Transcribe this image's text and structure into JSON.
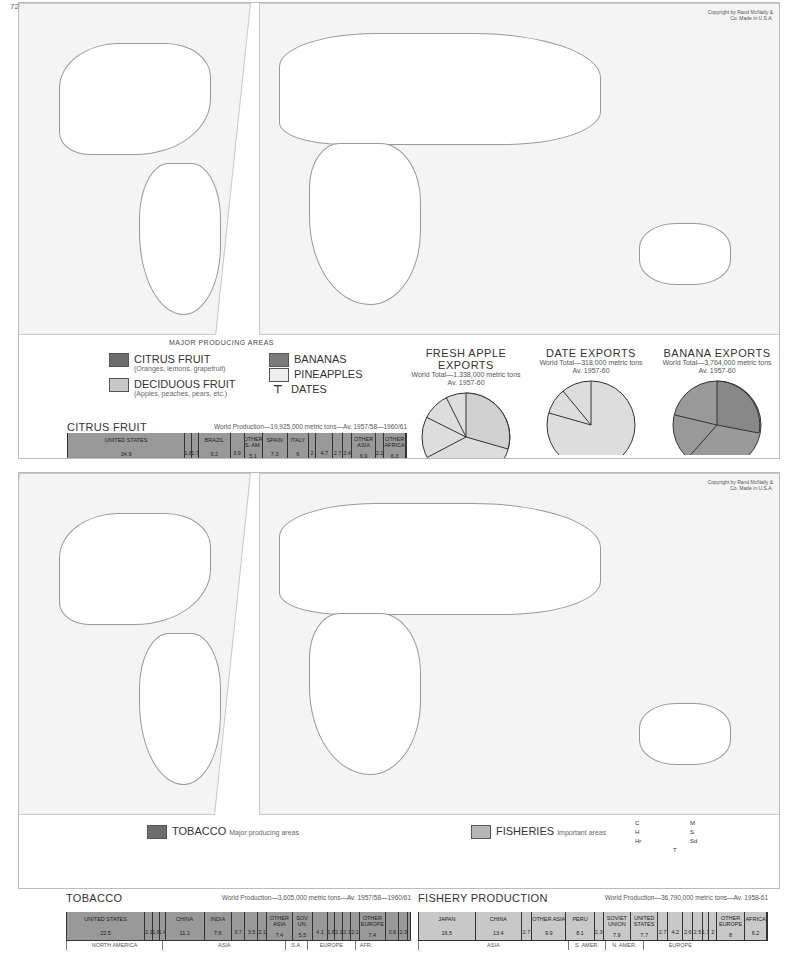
{
  "page_number": "72",
  "top_map": {
    "copyright": "Copyright by Rand McNally & Co. Made in U.S.A.",
    "subtitle": "MAJOR PRODUCING AREAS",
    "legend": [
      {
        "label": "CITRUS FRUIT",
        "note": "(Oranges, lemons, grapefruit)",
        "color": "#6e6e6e"
      },
      {
        "label": "DECIDUOUS FRUIT",
        "note": "(Apples, peaches, pears, etc.)",
        "color": "#c8c8c8"
      },
      {
        "label": "BANANAS",
        "note": "",
        "color": "#7a7a7a"
      },
      {
        "label": "PINEAPPLES",
        "note": "",
        "color": "#eeeeee"
      },
      {
        "label": "DATES",
        "note": "",
        "symbol": "T"
      }
    ],
    "map_labels": [
      "Arctic Circle",
      "Tropic of Cancer",
      "Equator",
      "Tropic of Capricorn"
    ]
  },
  "bottom_map": {
    "copyright": "Copyright by Rand McNally & Co. Made in U.S.A.",
    "legend": [
      {
        "label": "TOBACCO",
        "note": "Major producing areas",
        "color": "#6e6e6e"
      },
      {
        "label": "FISHERIES",
        "note": "Important areas",
        "color": "#b5b5b5"
      }
    ],
    "fish_codes": [
      {
        "code": "C",
        "name": "COD"
      },
      {
        "code": "M",
        "name": "MACKEREL"
      },
      {
        "code": "H",
        "name": "HALIBUT"
      },
      {
        "code": "S",
        "name": "SALMON"
      },
      {
        "code": "Hr",
        "name": "HERRING"
      },
      {
        "code": "Sd",
        "name": "SARDINE"
      },
      {
        "code": "T",
        "name": "TUNA"
      }
    ]
  },
  "chart_data": [
    {
      "type": "pie",
      "title": "FRESH APPLE EXPORTS",
      "subtitle": "World Total—1,338,000 metric tons",
      "period": "Av. 1957-60",
      "slices": [
        {
          "label": "ITALY",
          "value": 34.6
        },
        {
          "label": "NETH.",
          "value": 5.8
        },
        {
          "label": "OTHER",
          "value": 7.3
        },
        {
          "label": "ARGEN.",
          "value": 5.3
        },
        {
          "label": "AUSTL.",
          "value": 7.0
        },
        {
          "label": "OTHER ASIA",
          "value": 1.7
        },
        {
          "label": "CHINA",
          "value": 6.5
        },
        {
          "label": "CAN.",
          "value": 5.5
        },
        {
          "label": "U.S.",
          "value": 6.1
        },
        {
          "label": "OTHER N. AM.",
          "value": 2.4
        },
        {
          "label": "KOREA",
          "value": 2.5
        },
        {
          "label": "SWITZ.",
          "value": 2.8
        }
      ],
      "groups": [
        "N. AM.",
        "ASIA",
        "OCEANIA",
        "S. AM.",
        "EUROPE 55.6%"
      ]
    },
    {
      "type": "pie",
      "title": "DATE EXPORTS",
      "subtitle": "World Total—318,000 metric tons",
      "period": "Av. 1957-60",
      "slices": [
        {
          "label": "IRAQ",
          "value": 76.7
        },
        {
          "label": "IRAN",
          "value": 8.0
        },
        {
          "label": "ALG.",
          "value": 6.7
        },
        {
          "label": "FRANCE",
          "value": 2.6
        },
        {
          "label": "OTHER",
          "value": 6.0
        }
      ],
      "groups": [
        "AFR.",
        "EUR.",
        "ASIA 87.8%"
      ]
    },
    {
      "type": "pie",
      "title": "BANANA EXPORTS",
      "subtitle": "World Total—3,764,000 metric tons",
      "period": "Av. 1957-60",
      "slices": [
        {
          "label": "ECUADOR",
          "value": 25.9
        },
        {
          "label": "BRAZIL",
          "value": 6.3
        },
        {
          "label": "COL.",
          "value": 3.8
        },
        {
          "label": "HONDURAS",
          "value": 7.6
        },
        {
          "label": "PANAMA",
          "value": 7.4
        },
        {
          "label": "COSTA RICA",
          "value": 5.0
        },
        {
          "label": "GUAT.",
          "value": 4.7
        },
        {
          "label": "OTHER N. AM.",
          "value": 5.0
        },
        {
          "label": "MEX.",
          "value": 3.0
        },
        {
          "label": "CAN.",
          "value": 4.2
        },
        {
          "label": "FR. AFR.",
          "value": 6.3
        },
        {
          "label": "OTHER AFR.",
          "value": 11.0
        },
        {
          "label": "NIGERIA",
          "value": 2.0
        },
        {
          "label": "GUADELOUPE",
          "value": 2.7
        },
        {
          "label": "MARTINIQUE",
          "value": 3.0
        }
      ],
      "groups": [
        "AFRICA",
        "SOUTH AMERICA 36.3%",
        "NORTH AMERICA 45.2%"
      ]
    },
    {
      "type": "bar",
      "title": "CITRUS FRUIT",
      "subtitle": "World Production—19,925,000 metric tons—Av. 1957/58—1960/61",
      "xlim": [
        0,
        100
      ],
      "ticks": [
        0,
        10,
        20,
        30,
        40,
        50,
        60,
        70,
        80,
        90,
        "100%"
      ],
      "categories": [
        "UNITED STATES",
        "MEX.",
        "CUBA",
        "BRAZIL",
        "ARGEN.",
        "OTHER S. AM.",
        "SPAIN",
        "ITALY",
        "OTHER EUR.",
        "JAPAN",
        "ISRAEL",
        "CHINA",
        "OTHER ASIA",
        "U.A.R.",
        "OTHER AFRICA"
      ],
      "values": [
        34.9,
        1.8,
        1.7,
        9.2,
        3.9,
        5.1,
        7.3,
        6.0,
        2.0,
        4.7,
        2.7,
        2.4,
        6.9,
        2.1,
        6.3
      ],
      "regions": [
        {
          "name": "NORTH AMERICA",
          "span": 38.4
        },
        {
          "name": "S. AMERICA",
          "span": 18.2
        },
        {
          "name": "EUROPE",
          "span": 15.3
        },
        {
          "name": "ASIA",
          "span": 16.7
        },
        {
          "name": "AFR.",
          "span": 8.4
        }
      ]
    },
    {
      "type": "bar",
      "title": "TOBACCO",
      "subtitle": "World Production—3,605,000 metric tons—Av. 1957/58—1960/61",
      "xlim": [
        0,
        100
      ],
      "ticks": [
        0,
        10,
        20,
        30,
        40,
        50,
        60,
        70,
        80,
        90,
        "100%"
      ],
      "categories": [
        "UNITED STATES",
        "CAN.",
        "MEX.",
        "OTHER",
        "CHINA",
        "INDIA",
        "JAPAN",
        "TURK.",
        "PAK.",
        "OTHER ASIA",
        "SOV. UN.",
        "BRAZ.",
        "OTHER",
        "BULG.",
        "GR.",
        "ITALY",
        "OTHER EUROPE",
        "RH.-NY.",
        "OTHER"
      ],
      "values": [
        22.5,
        2.1,
        1.6,
        1.4,
        11.1,
        7.6,
        3.7,
        3.5,
        2.1,
        7.4,
        5.5,
        4.1,
        1.8,
        2.1,
        2.1,
        2.1,
        7.4,
        3.6,
        2.3
      ],
      "regions": [
        {
          "name": "NORTH AMERICA",
          "span": 27.6
        },
        {
          "name": "ASIA",
          "span": 35.4
        },
        {
          "name": "S.A.",
          "span": 5.9
        },
        {
          "name": "EUROPE",
          "span": 13.7
        },
        {
          "name": "AFR.",
          "span": 5.9
        }
      ]
    },
    {
      "type": "bar",
      "title": "FISHERY PRODUCTION",
      "subtitle": "World Production—36,790,000 metric tons—Av. 1958-61",
      "xlim": [
        0,
        100
      ],
      "ticks": [
        0,
        10,
        20,
        30,
        40,
        50,
        60,
        70,
        80,
        90,
        "100%"
      ],
      "categories": [
        "JAPAN",
        "CHINA",
        "INDIA",
        "OTHER ASIA",
        "PERU",
        "OTHER",
        "SOVIET UNION",
        "UNITED STATES",
        "CAN.",
        "NOR.",
        "U.K.",
        "SPAIN",
        "OTHER",
        "DEN.",
        "OTHER EUROPE",
        "AFRICA"
      ],
      "values": [
        16.5,
        13.4,
        2.7,
        9.9,
        8.1,
        2.3,
        7.9,
        7.7,
        2.7,
        4.2,
        2.6,
        2.5,
        1.7,
        2.0,
        8.0,
        6.2
      ],
      "regions": [
        {
          "name": "ASIA",
          "span": 42.5
        },
        {
          "name": "S. AMER.",
          "span": 10.4
        },
        {
          "name": "N. AMER.",
          "span": 10.4
        },
        {
          "name": "EUROPE",
          "span": 21.0
        }
      ]
    }
  ]
}
